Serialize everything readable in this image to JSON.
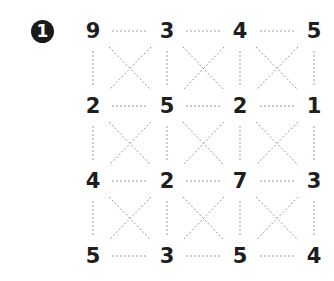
{
  "puzzle": {
    "number": "1",
    "grid": [
      [
        "9",
        "3",
        "4",
        "5"
      ],
      [
        "2",
        "5",
        "2",
        "1"
      ],
      [
        "4",
        "2",
        "7",
        "3"
      ],
      [
        "5",
        "3",
        "5",
        "4"
      ]
    ],
    "line_color": "#9a9a9a",
    "number_color": "#1e1e1e"
  }
}
